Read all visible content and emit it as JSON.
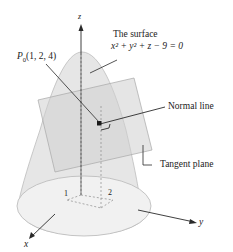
{
  "diagram": {
    "axes": {
      "x": "x",
      "y": "y",
      "z": "z"
    },
    "tick_labels": {
      "x_tick": "1",
      "y_tick": "2"
    },
    "point_label": {
      "name": "P",
      "subscript": "0",
      "coords": "(1, 2, 4)"
    },
    "surface_label": {
      "line1": "The surface",
      "equation": "x² + y² + z − 9 = 0"
    },
    "normal_label": "Normal line",
    "plane_label": "Tangent plane",
    "colors": {
      "surface_fill": "#e6e6e6",
      "surface_edge": "#b5b5b5",
      "plane_fill": "#d4d4d4",
      "line": "#2a2a2a"
    }
  }
}
